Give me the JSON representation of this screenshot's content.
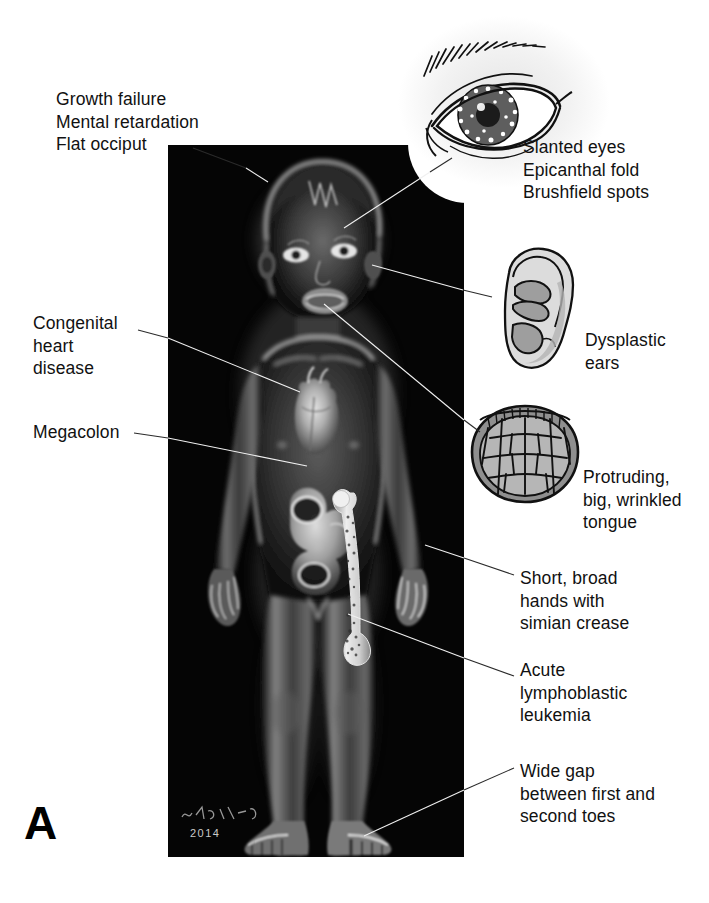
{
  "figure": {
    "panel_letter": "A",
    "signature_year": "2014",
    "signature_artist": "H.P. Fischer"
  },
  "labels": {
    "top_left": {
      "lines": [
        "Growth failure",
        "Mental retardation",
        "Flat occiput"
      ],
      "text": "Growth failure\nMental retardation\nFlat occiput"
    },
    "heart": {
      "lines": [
        "Congenital",
        "heart",
        "disease"
      ],
      "text": "Congenital\nheart\ndisease"
    },
    "megacolon": {
      "lines": [
        "Megacolon"
      ],
      "text": "Megacolon"
    },
    "eyes": {
      "lines": [
        "Slanted eyes",
        "Epicanthal fold",
        "Brushfield spots"
      ],
      "text": "Slanted eyes\nEpicanthal fold\nBrushfield spots"
    },
    "ears": {
      "lines": [
        "Dysplastic",
        "ears"
      ],
      "text": "Dysplastic\nears"
    },
    "tongue": {
      "lines": [
        "Protruding,",
        "big, wrinkled",
        "tongue"
      ],
      "text": "Protruding,\nbig, wrinkled\ntongue"
    },
    "hands": {
      "lines": [
        "Short, broad",
        "hands with",
        "simian crease"
      ],
      "text": "Short, broad\nhands with\nsimian crease"
    },
    "leukemia": {
      "lines": [
        "Acute",
        "lymphoblastic",
        "leukemia"
      ],
      "text": "Acute\nlymphoblastic\nleukemia"
    },
    "toes": {
      "lines": [
        "Wide gap",
        "between first and",
        "second toes"
      ],
      "text": "Wide gap\nbetween first and\nsecond toes"
    }
  },
  "insets": {
    "eye": {
      "name": "slanted-eye-with-brushfield-spots"
    },
    "ear": {
      "name": "dysplastic-ear"
    },
    "tongue": {
      "name": "wrinkled-protruding-tongue"
    }
  },
  "colors": {
    "page_background": "#ffffff",
    "panel_background": "#050505",
    "text": "#111111",
    "leader_line_dark": "#1a1a1a",
    "leader_line_light": "#e8e8e8",
    "inset_fill": "#d9d9d9",
    "inset_shade": "#9a9a9a",
    "inset_outline": "#111111"
  }
}
